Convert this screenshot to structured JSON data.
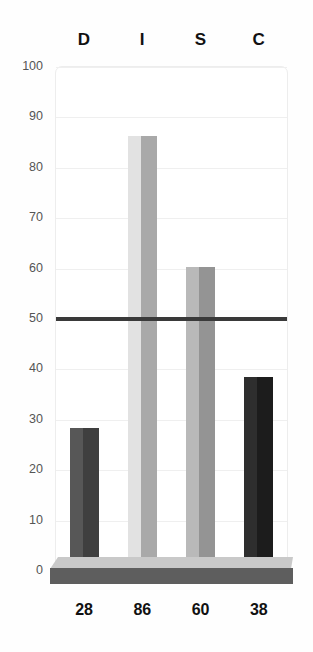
{
  "chart_data": {
    "type": "bar",
    "title": "",
    "subtitle": "",
    "xlabel": "",
    "ylabel": "",
    "categories": [
      "D",
      "I",
      "S",
      "C"
    ],
    "values": [
      28,
      86,
      60,
      38
    ],
    "value_labels": [
      "28",
      "86",
      "60",
      "38"
    ],
    "ylim": [
      0,
      100
    ],
    "y_ticks": [
      100,
      90,
      80,
      70,
      60,
      50,
      40,
      30,
      20,
      10,
      0
    ],
    "y_tick_labels": [
      "100",
      "90",
      "80",
      "70",
      "60",
      "50",
      "40",
      "30",
      "20",
      "10",
      "0"
    ],
    "grid": true,
    "legend": "none",
    "annotations": [
      {
        "name": "midline",
        "type": "horizontal-reference-line",
        "value": 50,
        "color": "#3a3a3a"
      }
    ],
    "series": [
      {
        "name": "DISC score",
        "values": [
          28,
          86,
          60,
          38
        ]
      }
    ],
    "bar_colors_left": [
      "#575757",
      "#e2e2e2",
      "#b9b9b9",
      "#2e2e2e"
    ],
    "bar_colors_right": [
      "#3f3f3f",
      "#a9a9a9",
      "#949494",
      "#1c1c1c"
    ]
  },
  "colors": {
    "background": "#fefefe",
    "plot_border": "#ededed",
    "gridline": "#efefef",
    "reference_line": "#3a3a3a",
    "plinth_top": "#c9c9c9",
    "plinth_front": "#5e5e5e",
    "tick_label": "#555555",
    "header_label": "#111111",
    "value_label": "#111111"
  }
}
